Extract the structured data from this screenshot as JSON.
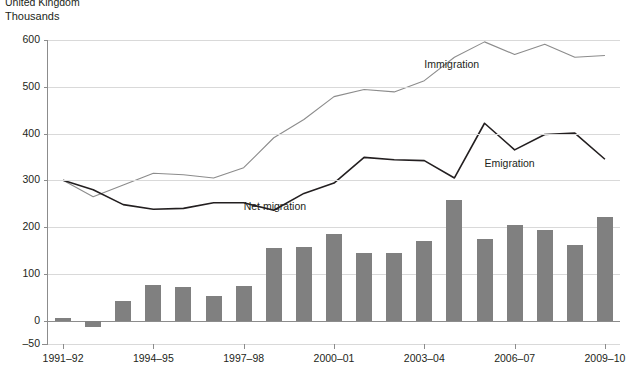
{
  "supertitle": "United Kingdom",
  "unit_label": "Thousands",
  "chart_data": {
    "type": "bar",
    "title": "United Kingdom",
    "subtitle": "Thousands",
    "xlabel": "",
    "ylabel": "Thousands",
    "ylim": [
      -50,
      600
    ],
    "yticks": [
      600,
      500,
      400,
      300,
      200,
      100,
      0,
      -50
    ],
    "ytick_labels": [
      "600",
      "500",
      "400",
      "300",
      "200",
      "100",
      "0",
      "–50"
    ],
    "grid": true,
    "legend": "inline-annotations",
    "categories": [
      "1991–92",
      "1992–93",
      "1993–94",
      "1994–95",
      "1995–96",
      "1996–97",
      "1997–98",
      "1998–99",
      "1999–00",
      "2000–01",
      "2001–02",
      "2002–03",
      "2003–04",
      "2004–05",
      "2005–06",
      "2006–07",
      "2007–08",
      "2008–09",
      "2009–10"
    ],
    "xtick_labels": [
      "1991–92",
      "1994–95",
      "1997–98",
      "2000–01",
      "2003–04",
      "2006–07",
      "2009–10"
    ],
    "xtick_indices": [
      0,
      3,
      6,
      9,
      12,
      15,
      18
    ],
    "series": [
      {
        "name": "Net migration",
        "chart_type": "bar",
        "color": "#808080",
        "values": [
          5,
          -13,
          42,
          77,
          72,
          53,
          75,
          155,
          158,
          185,
          145,
          145,
          171,
          258,
          174,
          204,
          193,
          162,
          222
        ]
      },
      {
        "name": "Immigration",
        "chart_type": "line",
        "color": "#8c8c8c",
        "values": [
          300,
          265,
          290,
          315,
          312,
          305,
          327,
          391,
          430,
          479,
          494,
          489,
          513,
          563,
          596,
          569,
          591,
          563,
          567
        ]
      },
      {
        "name": "Emigration",
        "chart_type": "line",
        "color": "#231f20",
        "values": [
          300,
          280,
          248,
          238,
          240,
          252,
          252,
          236,
          272,
          294,
          349,
          344,
          342,
          305,
          422,
          365,
          398,
          401,
          345
        ]
      }
    ],
    "annotations": [
      {
        "text": "Immigration",
        "x_index": 12,
        "y": 546
      },
      {
        "text": "Emigration",
        "x_index": 14,
        "y": 335
      },
      {
        "text": "Net migration",
        "x_index": 6,
        "y": 243
      }
    ]
  }
}
